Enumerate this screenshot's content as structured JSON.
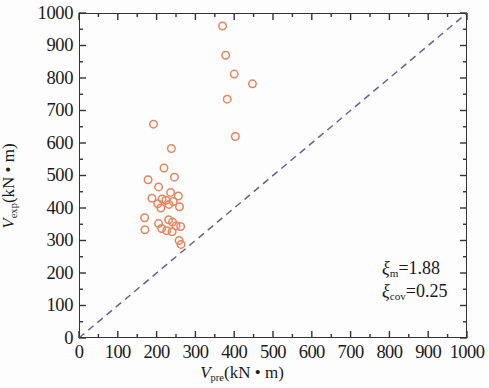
{
  "figure": {
    "background": "#fdfdfd",
    "frame_color": "#333333"
  },
  "axes": {
    "x": {
      "title_symbol": "V",
      "title_sub": "pre",
      "title_units": "(kN • m)",
      "title_full": "Vpre(kN • m)",
      "min": 0,
      "max": 1000,
      "ticks": [
        0,
        100,
        200,
        300,
        400,
        500,
        600,
        700,
        800,
        900,
        1000
      ],
      "tick_labels": [
        "0",
        "100",
        "200",
        "300",
        "400",
        "500",
        "600",
        "700",
        "800",
        "900",
        "1000"
      ],
      "minor_ticks_per_interval": 1
    },
    "y": {
      "title_symbol": "V",
      "title_sub": "exp",
      "title_units": "(kN • m)",
      "title_full": "Vexp(kN • m)",
      "min": 0,
      "max": 1000,
      "ticks": [
        0,
        100,
        200,
        300,
        400,
        500,
        600,
        700,
        800,
        900,
        1000
      ],
      "tick_labels": [
        "0",
        "100",
        "200",
        "300",
        "400",
        "500",
        "600",
        "700",
        "800",
        "900",
        "1000"
      ],
      "minor_ticks_per_interval": 1
    }
  },
  "annotations": [
    {
      "name": "xi-mean",
      "symbol": "ξ",
      "sub": "m",
      "text": "=1.88",
      "full": "ξm=1.88"
    },
    {
      "name": "xi-cov",
      "symbol": "ξ",
      "sub": "cov",
      "text": "=0.25",
      "full": "ξcov=0.25"
    }
  ],
  "chart_data": {
    "type": "scatter",
    "title": "",
    "xlabel": "Vpre(kN • m)",
    "ylabel": "Vexp(kN • m)",
    "xlim": [
      0,
      1000
    ],
    "ylim": [
      0,
      1000
    ],
    "grid": false,
    "legend": null,
    "marker": {
      "shape": "circle",
      "filled": false,
      "edge_color": "#e8835c",
      "size_px": 7.5,
      "line_width": 1.5
    },
    "reference_line": {
      "name": "equality-line",
      "style": "dashed",
      "color": "#4a4a80",
      "from": [
        0,
        0
      ],
      "to": [
        1000,
        1000
      ],
      "label": "y = x"
    },
    "series": [
      {
        "name": "Vexp vs Vpre",
        "points": [
          [
            370,
            960
          ],
          [
            378,
            870
          ],
          [
            400,
            812
          ],
          [
            447,
            782
          ],
          [
            382,
            735
          ],
          [
            192,
            658
          ],
          [
            403,
            620
          ],
          [
            238,
            583
          ],
          [
            219,
            523
          ],
          [
            246,
            495
          ],
          [
            178,
            487
          ],
          [
            205,
            465
          ],
          [
            236,
            448
          ],
          [
            256,
            437
          ],
          [
            188,
            430
          ],
          [
            214,
            428
          ],
          [
            224,
            424
          ],
          [
            243,
            420
          ],
          [
            203,
            413
          ],
          [
            232,
            411
          ],
          [
            259,
            404
          ],
          [
            211,
            400
          ],
          [
            169,
            370
          ],
          [
            231,
            364
          ],
          [
            241,
            357
          ],
          [
            205,
            352
          ],
          [
            250,
            345
          ],
          [
            262,
            343
          ],
          [
            170,
            333
          ],
          [
            213,
            337
          ],
          [
            226,
            330
          ],
          [
            240,
            327
          ],
          [
            258,
            300
          ],
          [
            263,
            288
          ]
        ]
      }
    ]
  }
}
